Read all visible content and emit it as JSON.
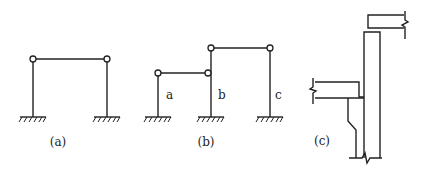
{
  "colors": {
    "stroke": "#222222",
    "background": "#ffffff"
  },
  "figures": {
    "a": {
      "caption": "(a)",
      "description": "Single-bay portal frame with two hinged beam-column joints and fixed bases"
    },
    "b": {
      "caption": "(b)",
      "description": "Two-bay stepped frame with hinged joints and three fixed-base columns",
      "column_labels": [
        "a",
        "b",
        "c"
      ]
    },
    "c": {
      "caption": "(c)",
      "description": "Detail of column with offset beams at two levels, shown with break lines"
    }
  }
}
